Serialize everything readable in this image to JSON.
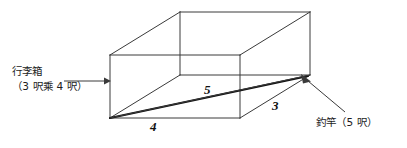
{
  "figure": {
    "type": "geometry-diagram",
    "background_color": "#ffffff",
    "line_color": "#3a3a3a",
    "bold_line_color": "#111111"
  },
  "annotations": {
    "suitcase": {
      "name_line": "行李箱",
      "size_line": "（3 呎乘 4 呎）",
      "pointer": "arrow-right"
    },
    "rod": {
      "text": "釣竿（5 呎）",
      "pointer": "arrow-up-left"
    }
  },
  "dimensions": {
    "diagonal": "5",
    "width": "4",
    "depth": "3"
  }
}
